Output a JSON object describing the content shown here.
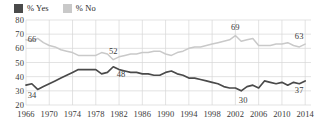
{
  "legend": {
    "position": "top-left",
    "entries": [
      {
        "label": "% Yes",
        "color": "#4a4a4a",
        "icon": "square-swatch-icon"
      },
      {
        "label": "% No",
        "color": "#c9c9c9",
        "icon": "square-swatch-icon"
      }
    ]
  },
  "axes": {
    "y": {
      "ticks": [
        "80",
        "70",
        "60",
        "50",
        "40",
        "30",
        "20"
      ],
      "min": 20,
      "max": 80,
      "step": 10
    },
    "x": {
      "ticks": [
        "1966",
        "1970",
        "1974",
        "1978",
        "1982",
        "1986",
        "1990",
        "1994",
        "1998",
        "2002",
        "2006",
        "2010",
        "2014"
      ],
      "min": 1966,
      "max": 2015,
      "step": 4
    }
  },
  "annotations": [
    {
      "text": "66",
      "series": "% No",
      "year": 1966,
      "value": 66,
      "anchor": "left-above"
    },
    {
      "text": "34",
      "series": "% Yes",
      "year": 1966,
      "value": 34,
      "anchor": "left-below"
    },
    {
      "text": "52",
      "series": "% No",
      "year": 1981,
      "value": 52,
      "anchor": "above"
    },
    {
      "text": "48",
      "series": "% Yes",
      "year": 1982,
      "value": 48,
      "anchor": "below"
    },
    {
      "text": "69",
      "series": "% No",
      "year": 2002,
      "value": 69,
      "anchor": "above"
    },
    {
      "text": "30",
      "series": "% Yes",
      "year": 2003,
      "value": 30,
      "anchor": "below"
    },
    {
      "text": "63",
      "series": "% No",
      "year": 2014,
      "value": 63,
      "anchor": "right-above"
    },
    {
      "text": "37",
      "series": "% Yes",
      "year": 2014,
      "value": 37,
      "anchor": "right-below"
    }
  ],
  "chart_data": {
    "type": "line",
    "title": "",
    "subtitle": "",
    "xlabel": "",
    "ylabel": "",
    "xlim": [
      1966,
      2015
    ],
    "ylim": [
      20,
      80
    ],
    "grid": true,
    "legend_position": "top-left",
    "x": [
      1966,
      1967,
      1968,
      1969,
      1970,
      1971,
      1972,
      1973,
      1974,
      1975,
      1976,
      1977,
      1978,
      1979,
      1980,
      1981,
      1982,
      1983,
      1984,
      1985,
      1986,
      1987,
      1988,
      1989,
      1990,
      1991,
      1992,
      1993,
      1994,
      1995,
      1996,
      1997,
      1998,
      1999,
      2000,
      2001,
      2002,
      2003,
      2004,
      2005,
      2006,
      2007,
      2008,
      2009,
      2010,
      2011,
      2012,
      2013,
      2014
    ],
    "series": [
      {
        "name": "% Yes",
        "color": "#4a4a4a",
        "values": [
          34,
          35,
          31,
          33,
          35,
          37,
          39,
          41,
          43,
          45,
          45,
          45,
          45,
          42,
          43,
          47,
          45,
          44,
          43,
          43,
          42,
          42,
          41,
          41,
          43,
          44,
          42,
          41,
          39,
          39,
          38,
          37,
          36,
          35,
          33,
          32,
          32,
          30,
          33,
          34,
          32,
          37,
          36,
          35,
          36,
          34,
          36,
          35,
          37
        ]
      },
      {
        "name": "% No",
        "color": "#c9c9c9",
        "values": [
          66,
          65,
          67,
          64,
          62,
          61,
          59,
          58,
          57,
          55,
          55,
          55,
          55,
          57,
          56,
          52,
          54,
          55,
          56,
          56,
          57,
          57,
          58,
          58,
          56,
          55,
          57,
          58,
          60,
          61,
          61,
          62,
          63,
          64,
          65,
          66,
          69,
          65,
          66,
          67,
          62,
          62,
          62,
          63,
          63,
          64,
          62,
          61,
          63
        ]
      }
    ]
  }
}
